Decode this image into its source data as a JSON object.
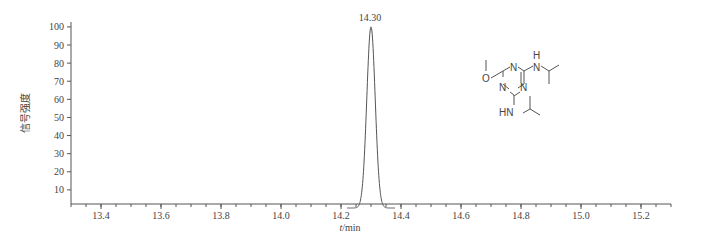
{
  "chart_data": {
    "type": "line",
    "title": "",
    "xlabel": "t/min",
    "ylabel": "信号强度",
    "xlim": [
      13.3,
      15.3
    ],
    "ylim": [
      0,
      100
    ],
    "x_ticks": [
      "13.4",
      "13.6",
      "13.8",
      "14.0",
      "14.2",
      "14.4",
      "14.6",
      "14.8",
      "15.0",
      "15.2"
    ],
    "y_ticks": [
      "10",
      "20",
      "30",
      "40",
      "50",
      "60",
      "70",
      "80",
      "90",
      "100"
    ],
    "grid": false,
    "legend": null,
    "series": [
      {
        "name": "chromatogram",
        "peak": {
          "retention_time": 14.3,
          "height": 100,
          "width_base": 0.08
        },
        "x": [
          13.3,
          14.2,
          14.25,
          14.27,
          14.28,
          14.29,
          14.3,
          14.31,
          14.32,
          14.33,
          14.35,
          14.4,
          15.3
        ],
        "values": [
          0,
          0,
          2,
          15,
          45,
          85,
          100,
          85,
          45,
          15,
          2,
          0,
          0
        ]
      }
    ],
    "annotations": [
      {
        "text": "14.30",
        "x": 14.3,
        "y": 100
      }
    ],
    "inset": {
      "type": "chemical-structure",
      "labels": [
        "O",
        "N",
        "N",
        "N",
        "H",
        "N",
        "HN"
      ],
      "description": "2,4-bis(isopropylamino)-6-methoxy-1,3,5-triazine (prometon)"
    }
  },
  "labels": {
    "peak_label": "14.30",
    "x_axis_italic": "t",
    "x_axis_unit": "/min",
    "y_axis": "信号强度",
    "struct_O": "O",
    "struct_N1": "N",
    "struct_N2": "N",
    "struct_N3": "N",
    "struct_NH_top_H": "H",
    "struct_NH_top_N": "N",
    "struct_HN": "HN"
  }
}
